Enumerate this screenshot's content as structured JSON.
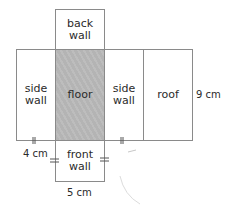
{
  "diagram": {
    "title": "",
    "faces": {
      "back_wall": "back\nwall",
      "left_side_wall": "side\nwall",
      "floor": "floor",
      "right_side_wall": "side\nwall",
      "roof": "roof",
      "front_wall": "front\nwall"
    },
    "dimensions": {
      "height": "9 cm",
      "side_width": "4 cm",
      "front_width": "5 cm"
    },
    "colors": {
      "outline": "#8a8a8a",
      "floor_fill": "#b8b8b8",
      "text": "#2a2a2a"
    }
  }
}
